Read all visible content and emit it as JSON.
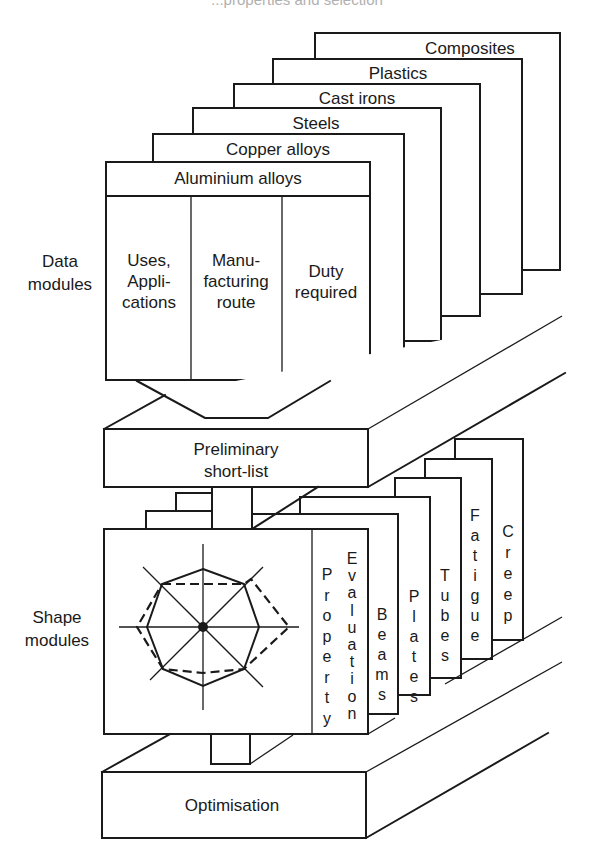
{
  "header": {
    "cut_off_caption": "...properties and selection"
  },
  "side_labels": {
    "data_modules": [
      "Data",
      "modules"
    ],
    "shape_modules": [
      "Shape",
      "modules"
    ]
  },
  "data_modules": {
    "cards": [
      {
        "label": "Composites"
      },
      {
        "label": "Plastics"
      },
      {
        "label": "Cast irons"
      },
      {
        "label": "Steels"
      },
      {
        "label": "Copper alloys"
      },
      {
        "label": "Aluminium alloys"
      }
    ],
    "front_columns": [
      {
        "lines": [
          "Uses,",
          "Appli-",
          "cations"
        ]
      },
      {
        "lines": [
          "Manu-",
          "facturing",
          "route"
        ]
      },
      {
        "lines": [
          "Duty",
          "required"
        ]
      }
    ]
  },
  "preliminary": {
    "lines": [
      "Preliminary",
      "short-list"
    ]
  },
  "shape_modules": {
    "front_panel_labels": [
      "Property",
      "Evaluation"
    ],
    "cards": [
      {
        "label": "Beams"
      },
      {
        "label": "Plates"
      },
      {
        "label": "Tubes"
      },
      {
        "label": "Fatigue"
      },
      {
        "label": "Creep"
      }
    ],
    "radar_chart": {
      "axes": 8,
      "solid_polygon": "reference property profile",
      "dashed_polygon": "candidate material profile"
    }
  },
  "optimisation": {
    "label": "Optimisation"
  },
  "colors": {
    "line": "#1a1a1a",
    "background": "#ffffff"
  }
}
